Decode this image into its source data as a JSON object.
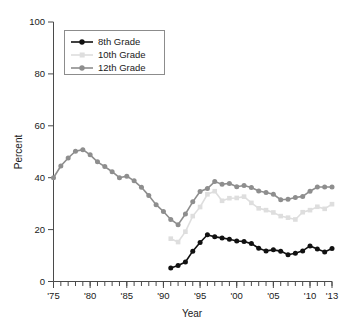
{
  "chart_data": {
    "type": "line",
    "title": "",
    "xlabel": "Year",
    "ylabel": "Percent",
    "xlim": [
      1975,
      2013
    ],
    "ylim": [
      0,
      100
    ],
    "yticks": [
      0,
      20,
      40,
      60,
      80,
      100
    ],
    "ytick_labels": [
      "0",
      "20",
      "40",
      "60",
      "80",
      "100"
    ],
    "xticks": [
      1975,
      1980,
      1985,
      1990,
      1995,
      2000,
      2005,
      2010,
      2013
    ],
    "xtick_labels": [
      "'75",
      "'80",
      "'85",
      "'90",
      "'95",
      "'00",
      "'05",
      "'10",
      "'13"
    ],
    "x_minor_tick_interval": 1,
    "grid": false,
    "legend_position": "top-left",
    "series": [
      {
        "name": "8th Grade",
        "color": "#111111",
        "marker": "circle",
        "x": [
          1991,
          1992,
          1993,
          1994,
          1995,
          1996,
          1997,
          1998,
          1999,
          2000,
          2001,
          2002,
          2003,
          2004,
          2005,
          2006,
          2007,
          2008,
          2009,
          2010,
          2011,
          2012,
          2013
        ],
        "values": [
          5.2,
          6.2,
          7.5,
          11.7,
          15.0,
          18.0,
          17.2,
          16.8,
          16.3,
          15.6,
          15.4,
          14.6,
          12.8,
          11.8,
          12.2,
          11.7,
          10.3,
          10.9,
          11.8,
          13.7,
          12.5,
          11.4,
          12.7
        ]
      },
      {
        "name": "10th Grade",
        "color": "#dedede",
        "marker": "square",
        "x": [
          1991,
          1992,
          1993,
          1994,
          1995,
          1996,
          1997,
          1998,
          1999,
          2000,
          2001,
          2002,
          2003,
          2004,
          2005,
          2006,
          2007,
          2008,
          2009,
          2010,
          2011,
          2012,
          2013
        ],
        "values": [
          16.5,
          15.2,
          19.2,
          25.2,
          28.7,
          33.6,
          34.8,
          31.1,
          32.1,
          32.2,
          32.7,
          30.3,
          28.2,
          27.5,
          26.6,
          25.2,
          24.6,
          23.9,
          26.7,
          27.5,
          28.8,
          28.0,
          29.8
        ]
      },
      {
        "name": "12th Grade",
        "color": "#8e8e8e",
        "marker": "circle",
        "x": [
          1975,
          1976,
          1977,
          1978,
          1979,
          1980,
          1981,
          1982,
          1983,
          1984,
          1985,
          1986,
          1987,
          1988,
          1989,
          1990,
          1991,
          1992,
          1993,
          1994,
          1995,
          1996,
          1997,
          1998,
          1999,
          2000,
          2001,
          2002,
          2003,
          2004,
          2005,
          2006,
          2007,
          2008,
          2009,
          2010,
          2011,
          2012,
          2013
        ],
        "values": [
          40.0,
          44.5,
          47.6,
          50.2,
          50.8,
          48.8,
          46.1,
          44.3,
          42.3,
          40.0,
          40.6,
          38.8,
          36.3,
          33.1,
          29.6,
          27.0,
          23.9,
          21.9,
          26.0,
          30.7,
          34.7,
          35.8,
          38.5,
          37.5,
          37.8,
          36.5,
          37.0,
          36.2,
          34.9,
          34.3,
          33.6,
          31.5,
          31.7,
          32.4,
          32.8,
          34.8,
          36.4,
          36.4,
          36.4
        ]
      }
    ]
  },
  "axes": {
    "y_title": "Percent",
    "x_title": "Year"
  },
  "legend": {
    "entries": [
      {
        "label": "8th Grade"
      },
      {
        "label": "10th Grade"
      },
      {
        "label": "12th Grade"
      }
    ]
  },
  "colors": {
    "grade8": "#111111",
    "grade10": "#dedede",
    "grade12": "#8e8e8e",
    "axis": "#4a4a4a",
    "text": "#1a1a1a",
    "background": "#ffffff"
  }
}
